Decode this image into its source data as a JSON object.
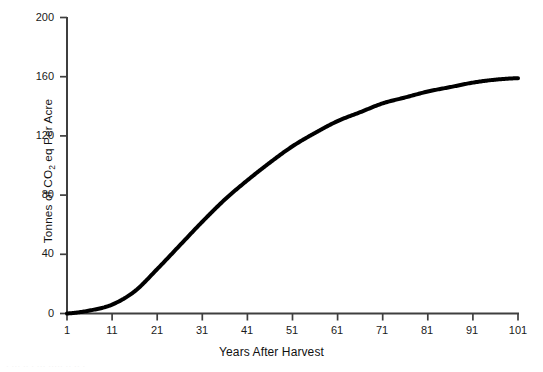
{
  "figure": {
    "background_color": "#ffffff",
    "line_color": "#000000",
    "axis_color": "#3f3f3f",
    "text_color": "#1a1a1a",
    "bottom_caption": "· ··· ·· · ··· ····· ·· ·· ·"
  },
  "chart_data": {
    "type": "line",
    "title": "",
    "subtitle": "",
    "xlabel": "Years After Harvest",
    "ylabel": "Tonnes of CO2 eq Per Acre",
    "ylabel_parts": {
      "before_sub": "Tonnes of CO",
      "subscript": "2",
      "after_sub": " eq Per Acre"
    },
    "xlim": [
      1,
      101
    ],
    "ylim": [
      0,
      200
    ],
    "xticks": [
      1,
      11,
      21,
      31,
      41,
      51,
      61,
      71,
      81,
      91,
      101
    ],
    "xtick_labels": [
      "1",
      "11",
      "21",
      "31",
      "41",
      "51",
      "61",
      "71",
      "81",
      "91",
      "101"
    ],
    "yticks": [
      0,
      40,
      80,
      120,
      160,
      200
    ],
    "ytick_labels": [
      "0",
      "40",
      "80",
      "120",
      "160",
      "200"
    ],
    "grid": false,
    "legend": null,
    "legend_position": "none",
    "line_width_px": 4,
    "series": [
      {
        "name": "Cumulative carbon stock",
        "x": [
          1,
          6,
          11,
          16,
          21,
          26,
          31,
          36,
          41,
          46,
          51,
          56,
          61,
          66,
          71,
          76,
          81,
          86,
          91,
          96,
          101
        ],
        "values": [
          0,
          2,
          6,
          15,
          30,
          46,
          62,
          77,
          90,
          102,
          113,
          122,
          130,
          136,
          142,
          146,
          150,
          153,
          156,
          158,
          159
        ]
      }
    ],
    "annotations": []
  }
}
